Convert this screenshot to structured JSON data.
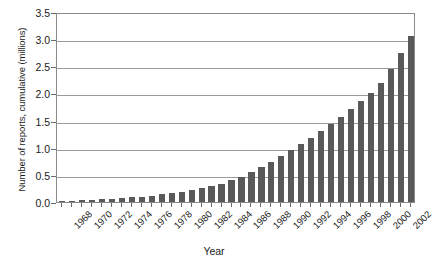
{
  "chart_data": {
    "type": "bar",
    "title": "",
    "xlabel": "Year",
    "ylabel": "Number of reports, cumulative (millions)",
    "ylim": [
      0.0,
      3.5
    ],
    "ytick_labels": [
      "0.0",
      "0.5",
      "1.0",
      "1.5",
      "2.0",
      "2.5",
      "3.0",
      "3.5"
    ],
    "ytick_values": [
      0.0,
      0.5,
      1.0,
      1.5,
      2.0,
      2.5,
      3.0,
      3.5
    ],
    "grid": "horizontal",
    "legend": "none",
    "bar_color": "#595959",
    "categories": [
      "1968",
      "1969",
      "1970",
      "1971",
      "1972",
      "1973",
      "1974",
      "1975",
      "1976",
      "1977",
      "1978",
      "1979",
      "1980",
      "1981",
      "1982",
      "1983",
      "1984",
      "1985",
      "1986",
      "1987",
      "1988",
      "1989",
      "1990",
      "1991",
      "1992",
      "1993",
      "1994",
      "1995",
      "1996",
      "1997",
      "1998",
      "1999",
      "2000",
      "2001",
      "2002",
      "2003"
    ],
    "values": [
      0.01,
      0.02,
      0.03,
      0.04,
      0.05,
      0.06,
      0.07,
      0.09,
      0.1,
      0.12,
      0.14,
      0.16,
      0.19,
      0.22,
      0.25,
      0.29,
      0.34,
      0.4,
      0.47,
      0.55,
      0.64,
      0.74,
      0.85,
      0.96,
      1.07,
      1.18,
      1.3,
      1.43,
      1.57,
      1.72,
      1.86,
      2.0,
      2.2,
      2.45,
      2.75,
      3.05
    ],
    "xtick_labels_shown": [
      "1968",
      "1970",
      "1972",
      "1974",
      "1976",
      "1978",
      "1980",
      "1982",
      "1984",
      "1986",
      "1988",
      "1990",
      "1992",
      "1994",
      "1996",
      "1998",
      "2000",
      "2002"
    ]
  }
}
